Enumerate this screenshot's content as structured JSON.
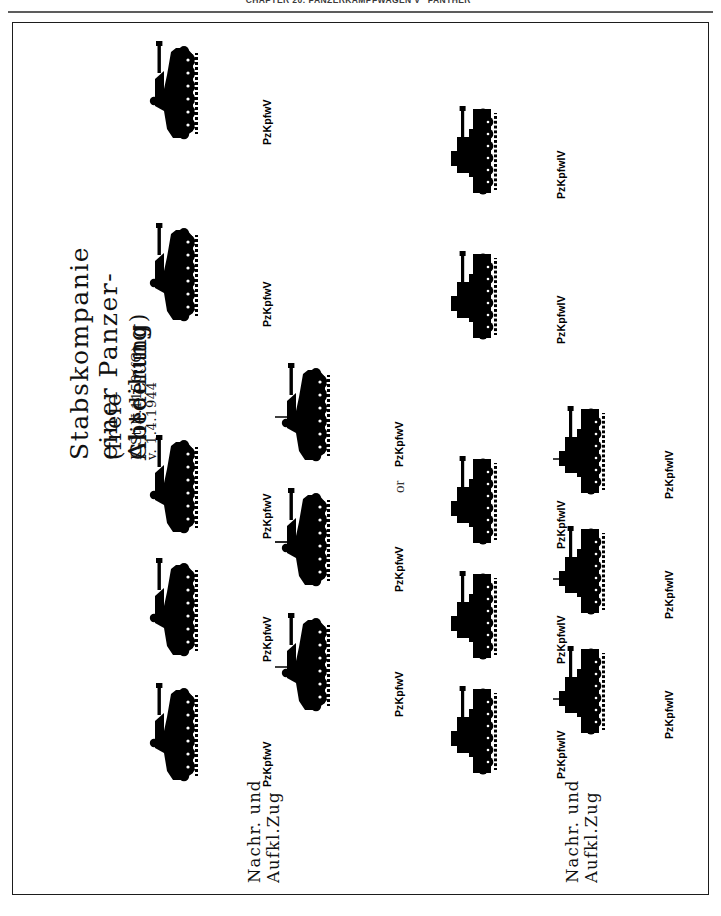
{
  "page": {
    "running_head": "CHAPTER 20: PANZERKAMPFWAGEN V \"PANTHER\"",
    "background_color": "#ffffff",
    "ink_color": "#000000",
    "orientation": "rotated-90-ccw"
  },
  "figure": {
    "title_line_1": "Stabskompanie einer Panzer-Abteilung",
    "title_line_2": "(freie Gliederung)",
    "title_line_3": "K.St.N.1150(fG) v. 1.4.1944",
    "alternative_word": "or",
    "groups": [
      {
        "id": "panther-variant",
        "unit_label_line_1": "Nachr. und",
        "unit_label_line_2": "Aufkl.Zug",
        "vehicle_type": "PzKpfwV",
        "command_tank_count": 3,
        "line_tank_count": 5,
        "total_tanks": 8,
        "command_tanks": [
          {
            "label": "PzKpfwV",
            "has_antenna": true
          },
          {
            "label": "PzKpfwV",
            "has_antenna": true
          },
          {
            "label": "PzKpfwV",
            "has_antenna": true
          }
        ],
        "line_tanks": [
          {
            "label": "PzKpfwV",
            "has_antenna": false
          },
          {
            "label": "PzKpfwV",
            "has_antenna": false
          },
          {
            "label": "PzKpfwV",
            "has_antenna": false
          },
          {
            "label": "PzKpfwV",
            "has_antenna": false
          },
          {
            "label": "PzKpfwV",
            "has_antenna": false
          }
        ]
      },
      {
        "id": "panzer-iv-variant",
        "unit_label_line_1": "Nachr. und",
        "unit_label_line_2": "Aufkl.Zug",
        "vehicle_type": "PzKpfwIV",
        "command_tank_count": 3,
        "line_tank_count": 5,
        "total_tanks": 8,
        "command_tanks": [
          {
            "label": "PzKpfwIV",
            "has_antenna": true
          },
          {
            "label": "PzKpfwIV",
            "has_antenna": true
          },
          {
            "label": "PzKpfwIV",
            "has_antenna": true
          }
        ],
        "line_tanks": [
          {
            "label": "PzKpfwIV",
            "has_antenna": false
          },
          {
            "label": "PzKpfwIV",
            "has_antenna": false
          },
          {
            "label": "PzKpfwIV",
            "has_antenna": false
          },
          {
            "label": "PzKpfwIV",
            "has_antenna": false
          },
          {
            "label": "PzKpfwIV",
            "has_antenna": false
          }
        ]
      }
    ]
  }
}
